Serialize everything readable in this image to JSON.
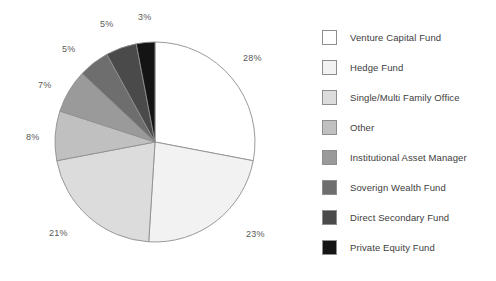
{
  "chart_data": {
    "type": "pie",
    "title": "",
    "subtitle": "",
    "xlabel": "",
    "ylabel": "",
    "legend_position": "right",
    "grid": false,
    "start_angle_deg": 0,
    "direction": "clockwise",
    "categories": [
      "Venture Capital Fund",
      "Hedge Fund",
      "Single/Multi Family Office",
      "Other",
      "Institutional Asset Manager",
      "Soverign Wealth Fund",
      "Direct Secondary Fund",
      "Private Equity Fund"
    ],
    "values": [
      28,
      23,
      21,
      8,
      7,
      5,
      5,
      3
    ],
    "value_labels": [
      "28%",
      "23%",
      "21%",
      "8%",
      "7%",
      "5%",
      "5%",
      "3%"
    ],
    "colors": [
      "#ffffff",
      "#f2f2f2",
      "#dcdcdc",
      "#c0c0c0",
      "#9a9a9a",
      "#6e6e6e",
      "#4a4a4a",
      "#141414"
    ],
    "slice_border_color": "#8e8e8e",
    "label_color": "#5a5a5a"
  },
  "pie": {
    "slices": [
      {
        "label": "Venture Capital Fund",
        "value": 28,
        "value_label": "28%",
        "color": "#ffffff",
        "label_x": 243,
        "label_y": 53
      },
      {
        "label": "Hedge Fund",
        "value": 23,
        "value_label": "23%",
        "color": "#f2f2f2",
        "label_x": 246,
        "label_y": 229
      },
      {
        "label": "Single/Multi Family Office",
        "value": 21,
        "value_label": "21%",
        "color": "#dcdcdc",
        "label_x": 49,
        "label_y": 228
      },
      {
        "label": "Other",
        "value": 8,
        "value_label": "8%",
        "color": "#c0c0c0",
        "label_x": 26,
        "label_y": 132
      },
      {
        "label": "Institutional Asset Manager",
        "value": 7,
        "value_label": "7%",
        "color": "#9a9a9a",
        "label_x": 38,
        "label_y": 80
      },
      {
        "label": "Soverign Wealth Fund",
        "value": 5,
        "value_label": "5%",
        "color": "#6e6e6e",
        "label_x": 62,
        "label_y": 44
      },
      {
        "label": "Direct Secondary Fund",
        "value": 5,
        "value_label": "5%",
        "color": "#4a4a4a",
        "label_x": 100,
        "label_y": 19
      },
      {
        "label": "Private Equity Fund",
        "value": 3,
        "value_label": "3%",
        "color": "#141414",
        "label_x": 138,
        "label_y": 12
      }
    ]
  },
  "legend": {
    "items": [
      {
        "label": "Venture Capital Fund",
        "color": "#ffffff"
      },
      {
        "label": "Hedge Fund",
        "color": "#f2f2f2"
      },
      {
        "label": "Single/Multi Family Office",
        "color": "#dcdcdc"
      },
      {
        "label": "Other",
        "color": "#c0c0c0"
      },
      {
        "label": "Institutional Asset Manager",
        "color": "#9a9a9a"
      },
      {
        "label": "Soverign Wealth Fund",
        "color": "#6e6e6e"
      },
      {
        "label": "Direct Secondary Fund",
        "color": "#4a4a4a"
      },
      {
        "label": "Private Equity Fund",
        "color": "#141414"
      }
    ]
  }
}
